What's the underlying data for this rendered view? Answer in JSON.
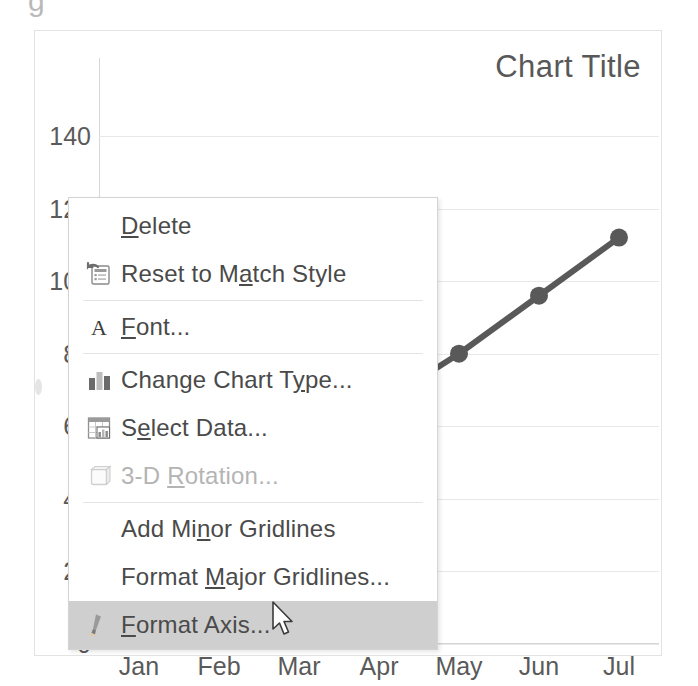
{
  "app": {
    "surface": "excel-chart-context-menu"
  },
  "chart": {
    "title": "Chart Title",
    "top_clip_glyph": "g"
  },
  "chart_data": {
    "type": "line",
    "title": "Chart Title",
    "xlabel": "",
    "ylabel": "",
    "categories": [
      "Jan",
      "Feb",
      "Mar",
      "Apr",
      "May",
      "Jun",
      "Jul"
    ],
    "series": [
      {
        "name": "Series 1",
        "values": [
          20,
          35,
          50,
          66,
          80,
          96,
          112
        ],
        "color": "#595959",
        "marker": "circle"
      }
    ],
    "ytick_labels": [
      "140",
      "120",
      "100",
      "80",
      "60",
      "40",
      "20",
      "0"
    ],
    "ytick_values": [
      140,
      120,
      100,
      80,
      60,
      40,
      20,
      0
    ],
    "ylim": [
      0,
      140
    ],
    "grid": true,
    "legend": "none"
  },
  "context_menu": {
    "items": [
      {
        "label": "Delete",
        "accel": "D",
        "icon": "none",
        "disabled": false,
        "highlighted": false,
        "separator_after": false
      },
      {
        "label": "Reset to Match Style",
        "accel": "a",
        "icon": "reset-style-icon",
        "disabled": false,
        "highlighted": false,
        "separator_after": true
      },
      {
        "label": "Font...",
        "accel": "F",
        "icon": "font-icon",
        "disabled": false,
        "highlighted": false,
        "separator_after": true
      },
      {
        "label": "Change Chart Type...",
        "accel": "y",
        "icon": "change-chart-type-icon",
        "disabled": false,
        "highlighted": false,
        "separator_after": false
      },
      {
        "label": "Select Data...",
        "accel": "e",
        "icon": "select-data-icon",
        "disabled": false,
        "highlighted": false,
        "separator_after": false
      },
      {
        "label": "3-D Rotation...",
        "accel": "R",
        "icon": "3d-rotation-icon",
        "disabled": true,
        "highlighted": false,
        "separator_after": true
      },
      {
        "label": "Add Minor Gridlines",
        "accel": "n",
        "icon": "none",
        "disabled": false,
        "highlighted": false,
        "separator_after": false
      },
      {
        "label": "Format Major Gridlines...",
        "accel": "M",
        "icon": "none",
        "disabled": false,
        "highlighted": false,
        "separator_after": false
      },
      {
        "label": "Format Axis...",
        "accel": "F",
        "icon": "format-axis-icon",
        "disabled": false,
        "highlighted": true,
        "separator_after": false
      }
    ]
  },
  "cursor": {
    "name": "mouse-pointer"
  },
  "colors": {
    "series": "#595959",
    "gridline": "#e8e8e8",
    "text": "#5a5a5a",
    "highlight": "#cfcfcf",
    "disabled_text": "#b4b4b4"
  }
}
